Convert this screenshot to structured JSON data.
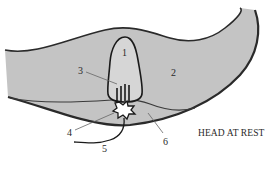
{
  "diagram": {
    "caption": "HEAD AT REST",
    "colors": {
      "background": "#ffffff",
      "fluid_region": "#c4c4c4",
      "hair_cell_fill": "#d6d6d6",
      "outline": "#2a2a2a",
      "nerve_ending_fill": "#ffffff",
      "leader_line": "#666666"
    },
    "labels": [
      {
        "id": "1",
        "text": "1"
      },
      {
        "id": "2",
        "text": "2"
      },
      {
        "id": "3",
        "text": "3"
      },
      {
        "id": "4",
        "text": "4"
      },
      {
        "id": "5",
        "text": "5"
      },
      {
        "id": "6",
        "text": "6"
      }
    ]
  }
}
